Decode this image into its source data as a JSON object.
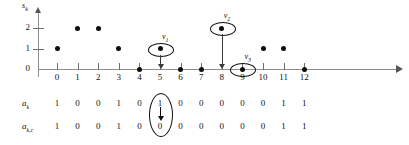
{
  "chart_data": {
    "type": "scatter",
    "title": "",
    "xlabel": "",
    "ylabel": "s_k",
    "ylabel_base": "s",
    "ylabel_sub": "k",
    "x": [
      0,
      1,
      2,
      3,
      4,
      5,
      6,
      7,
      8,
      9,
      10,
      11,
      12
    ],
    "values": [
      1,
      2,
      2,
      1,
      0,
      1,
      0,
      0,
      2,
      0,
      1,
      1,
      0
    ],
    "xticklabels": [
      "0",
      "1",
      "2",
      "3",
      "4",
      "5",
      "6",
      "7",
      "8",
      "9",
      "10",
      "11",
      "12"
    ],
    "yticklabels": [
      "0",
      "1",
      "2"
    ],
    "ytickvalues": [
      0,
      1,
      2
    ],
    "xlim": [
      0,
      12
    ],
    "ylim": [
      0,
      2.6
    ],
    "grid": false,
    "legend": false,
    "dot_color": "#0d0d0d",
    "axis_color": "#8f8f8f"
  },
  "annotations": [
    {
      "name": "v1",
      "base": "v",
      "sub": "1",
      "x": 5,
      "y": 1
    },
    {
      "name": "v2",
      "base": "v",
      "sub": "2",
      "x": 8,
      "y": 2
    },
    {
      "name": "v3",
      "base": "v",
      "sub": "3",
      "x": 9,
      "y": 0
    }
  ],
  "rows": [
    {
      "label_base": "a",
      "label_sub": "k",
      "values": [
        "1",
        "0",
        "0",
        "1",
        "0",
        "1",
        "0",
        "0",
        "0",
        "0",
        "0",
        "1",
        "1",
        "0"
      ]
    },
    {
      "label_base": "a",
      "label_sub": "k,c",
      "values": [
        "1",
        "0",
        "0",
        "1",
        "0",
        "0",
        "0",
        "0",
        "0",
        "0",
        "0",
        "1",
        "1",
        "0"
      ]
    }
  ],
  "row_highlight": {
    "column_index": 5,
    "top_value": "1",
    "bottom_value": "0"
  }
}
